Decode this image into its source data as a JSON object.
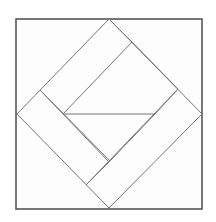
{
  "diagram": {
    "type": "geometric-quilt-block",
    "colors": {
      "background": "#ffffff",
      "fill": "#fdfdfd",
      "outer_stroke": "#555555",
      "inner_stroke": "#777777"
    },
    "outer_square": {
      "x": 16,
      "y": 19,
      "width": 186,
      "height": 190
    },
    "diamond": [
      [
        109,
        19
      ],
      [
        202,
        114
      ],
      [
        109,
        208
      ],
      [
        17,
        114
      ]
    ],
    "inner_lines": [
      [
        [
          63,
          114
        ],
        [
          132,
          42
        ]
      ],
      [
        [
          40,
          90
        ],
        [
          63,
          114
        ]
      ],
      [
        [
          109,
          19
        ],
        [
          132,
          42
        ]
      ],
      [
        [
          132,
          42
        ],
        [
          178,
          89
        ]
      ],
      [
        [
          178,
          89
        ],
        [
          155,
          114
        ]
      ],
      [
        [
          155,
          114
        ],
        [
          109,
          162
        ]
      ],
      [
        [
          63,
          114
        ],
        [
          109,
          162
        ]
      ],
      [
        [
          63,
          114
        ],
        [
          155,
          114
        ]
      ],
      [
        [
          178,
          89
        ],
        [
          86,
          185
        ]
      ],
      [
        [
          86,
          185
        ],
        [
          109,
          162
        ]
      ],
      [
        [
          40,
          90
        ],
        [
          109,
          160
        ]
      ]
    ]
  }
}
